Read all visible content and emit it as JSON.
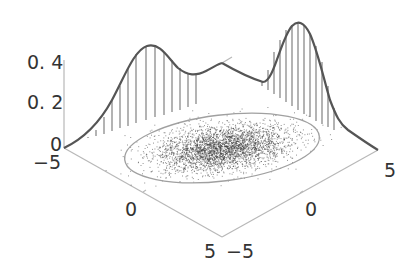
{
  "chart_data": {
    "type": "scatter",
    "subtype": "3d-bivariate-gaussian-mixture-with-marginals",
    "title": "",
    "xlabel": "",
    "ylabel": "",
    "zlabel": "",
    "x_axis": {
      "range": [
        -5,
        5
      ],
      "ticks": [
        -5,
        0,
        5
      ],
      "tick_labels": [
        "−5",
        "0",
        "5"
      ]
    },
    "y_axis": {
      "range": [
        -5,
        5
      ],
      "ticks": [
        -5,
        0,
        5
      ],
      "tick_labels": [
        "−5",
        "0",
        "5"
      ]
    },
    "z_axis": {
      "range": [
        0,
        0.4
      ],
      "ticks": [
        0,
        0.2,
        0.4
      ],
      "tick_labels": [
        "0",
        "0. 2",
        "0. 4"
      ]
    },
    "grid": false,
    "legend": null,
    "marginal_left": {
      "description": "bimodal marginal density projected on back-left wall",
      "x": [
        -5,
        -4,
        -3,
        -2,
        -1.5,
        -1,
        -0.5,
        0,
        1,
        2,
        3,
        4,
        5
      ],
      "density": [
        0.0,
        0.06,
        0.18,
        0.34,
        0.4,
        0.41,
        0.38,
        0.32,
        0.25,
        0.27,
        0.32,
        0.35,
        0.37
      ]
    },
    "marginal_right": {
      "description": "bimodal marginal density projected on back-right wall",
      "y": [
        -5,
        -4,
        -3,
        -2,
        -1,
        0,
        0.5,
        1,
        2,
        3,
        4,
        5
      ],
      "density": [
        0.37,
        0.3,
        0.27,
        0.32,
        0.45,
        0.52,
        0.49,
        0.4,
        0.2,
        0.1,
        0.05,
        0.0
      ]
    },
    "scatter": {
      "description": "dense point cloud of samples centered near origin, elongated along one diagonal",
      "center": [
        0,
        0
      ],
      "confidence_ellipse": true
    }
  },
  "labels": {
    "z_04": "0. 4",
    "z_02": "0. 2",
    "z_0": "0",
    "x_min": "−5",
    "x_mid": "0",
    "x_max": "5",
    "y_min": "−5",
    "y_mid": "0",
    "y_max": "5"
  },
  "colors": {
    "curve": "#555555",
    "stems": "#9a9a9a",
    "axis": "#b5b5b5",
    "ellipse": "#9d9d9d",
    "points": "#333333"
  }
}
